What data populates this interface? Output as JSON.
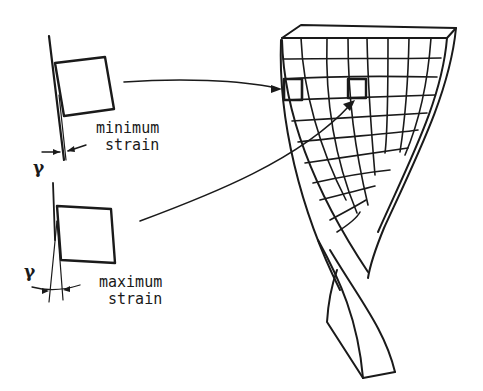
{
  "figure": {
    "labels": {
      "min_line1": "minimum",
      "min_line2": "strain",
      "max_line1": "maximum",
      "max_line2": "strain",
      "gamma_min": "γ",
      "gamma_max": "γ"
    },
    "colors": {
      "ink": "#1a1a1a",
      "background": "#ffffff"
    }
  }
}
